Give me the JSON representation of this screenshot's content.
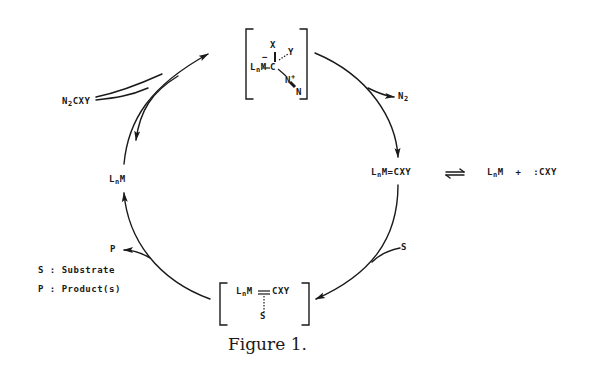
{
  "figure": {
    "caption": "Figure 1.",
    "colors": {
      "ink": "#1a1a1a",
      "background": "#ffffff"
    }
  },
  "species": {
    "top_intermediate": {
      "metal": "L",
      "metal_sub": "n",
      "metal_M": "M",
      "charge_minus": "−",
      "carbon": "C",
      "x": "X",
      "y": "Y",
      "n_plus": "N",
      "plus": "+",
      "n_terminal": "N"
    },
    "carbene": {
      "L": "L",
      "sub": "n",
      "rest": "M=CXY"
    },
    "equilibrium": {
      "arrow": "⇌",
      "products_L": "L",
      "products_sub": "n",
      "products_M": "M  +  :CXY"
    },
    "catalyst": {
      "L": "L",
      "sub": "n",
      "rest": "M"
    },
    "bottom_intermediate": {
      "L": "L",
      "sub": "n",
      "M": "M",
      "rest": "CXY",
      "substrate": "S"
    },
    "diazo": {
      "prefix": "N",
      "sub": "2",
      "rest": "CXY"
    }
  },
  "cycle_labels": {
    "n2_release": {
      "prefix": "N",
      "sub": "2"
    },
    "substrate_in": "S",
    "product_out": "P"
  },
  "legend": {
    "items": [
      {
        "key": "S",
        "sep": ":",
        "value": "Substrate"
      },
      {
        "key": "P",
        "sep": ":",
        "value": "Product(s)"
      }
    ]
  }
}
